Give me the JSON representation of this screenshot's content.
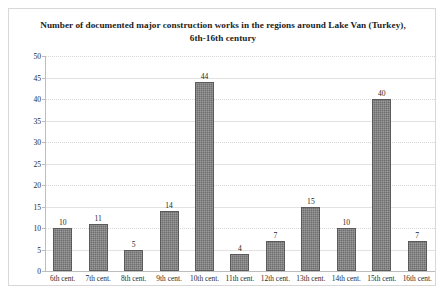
{
  "chart_data": {
    "type": "bar",
    "title": "Number of documented major construction works in the regions around Lake Van (Turkey), 6th-16th century",
    "title_line1": "Number of documented major construction works in the regions around Lake Van",
    "title_line2": "(Turkey), 6th-16th century",
    "xlabel": "",
    "ylabel": "",
    "ylim": [
      0,
      50
    ],
    "ytick_step": 5,
    "yticks": [
      50,
      45,
      40,
      35,
      30,
      25,
      20,
      15,
      10,
      5,
      0
    ],
    "ytick_labels": [
      "50",
      "45",
      "40",
      "35",
      "30",
      "25",
      "20",
      "15",
      "10",
      "5",
      "0"
    ],
    "grid": true,
    "grid_axis": "y",
    "legend": false,
    "legend_position": "none",
    "categories": [
      "6th cent.",
      "7th cent.",
      "8th cent.",
      "9th cent.",
      "10th cent.",
      "11th cent.",
      "12th cent.",
      "13th cent.",
      "14th cent.",
      "15th cent.",
      "16th cent."
    ],
    "values": [
      10,
      11,
      5,
      14,
      44,
      4,
      7,
      15,
      10,
      40,
      7
    ],
    "value_labels": [
      "10",
      "11",
      "5",
      "14",
      "44",
      "4",
      "7",
      "15",
      "10",
      "40",
      "7"
    ],
    "bar_color": "#6e6e6e",
    "bar_edge_color": "#5a5a5a",
    "grid_color": "#d6d6d6",
    "axis_color": "#bdbdbd",
    "frame_color": "#d8d8d8",
    "background_color": "#ffffff",
    "text_color": "#1c1c1c"
  }
}
